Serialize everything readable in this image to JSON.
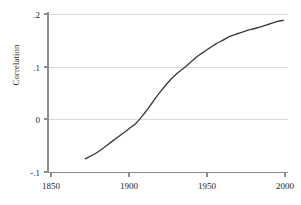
{
  "chart_data": {
    "type": "line",
    "title": "",
    "xlabel": "",
    "ylabel": "Correlation",
    "xlim": [
      1850,
      2000
    ],
    "ylim": [
      -0.1,
      0.2
    ],
    "grid": true,
    "legend": false,
    "x_ticks": [
      1850,
      1900,
      1950,
      2000
    ],
    "x_tick_labels": [
      "1850",
      "1900",
      "1950",
      "2000"
    ],
    "y_ticks": [
      -0.1,
      0,
      0.1,
      0.2
    ],
    "y_tick_labels": [
      "-.1",
      "0",
      ".1",
      ".2"
    ],
    "series": [
      {
        "name": "Correlation",
        "color": "#3b3b3b",
        "x": [
          1872,
          1880,
          1890,
          1900,
          1905,
          1910,
          1915,
          1920,
          1925,
          1930,
          1935,
          1940,
          1945,
          1950,
          1955,
          1960,
          1965,
          1970,
          1975,
          1980,
          1985,
          1990,
          1995,
          1999
        ],
        "y": [
          -0.075,
          -0.062,
          -0.04,
          -0.018,
          -0.006,
          0.012,
          0.032,
          0.052,
          0.07,
          0.085,
          0.097,
          0.11,
          0.122,
          0.132,
          0.142,
          0.15,
          0.158,
          0.163,
          0.168,
          0.172,
          0.176,
          0.181,
          0.186,
          0.188
        ]
      }
    ]
  },
  "axes": {
    "y_axis_title": "Correlation"
  },
  "labels": {
    "y": [
      "-.1",
      "0",
      ".1",
      ".2"
    ],
    "x": [
      "1850",
      "1900",
      "1950",
      "2000"
    ]
  },
  "colors": {
    "series": "#3b3b3b",
    "grid": "#d9d9d9",
    "axis": "#8d8d8d",
    "background": "#ffffff"
  }
}
